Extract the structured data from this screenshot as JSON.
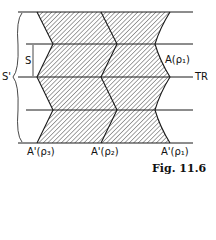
{
  "figure": {
    "caption": "Fig. 11.6",
    "labels": {
      "s_prime": "S'",
      "s": "S",
      "tr": "TR",
      "a_rho1": "A(ρ₁)",
      "a_prime_rho3": "A'(ρ₃)",
      "a_prime_rho2": "A'(ρ₂)",
      "a_prime_rho1": "A'(ρ₁)"
    },
    "colors": {
      "line": "#1a1a1a",
      "hatch": "#333333",
      "background": "#ffffff"
    }
  }
}
